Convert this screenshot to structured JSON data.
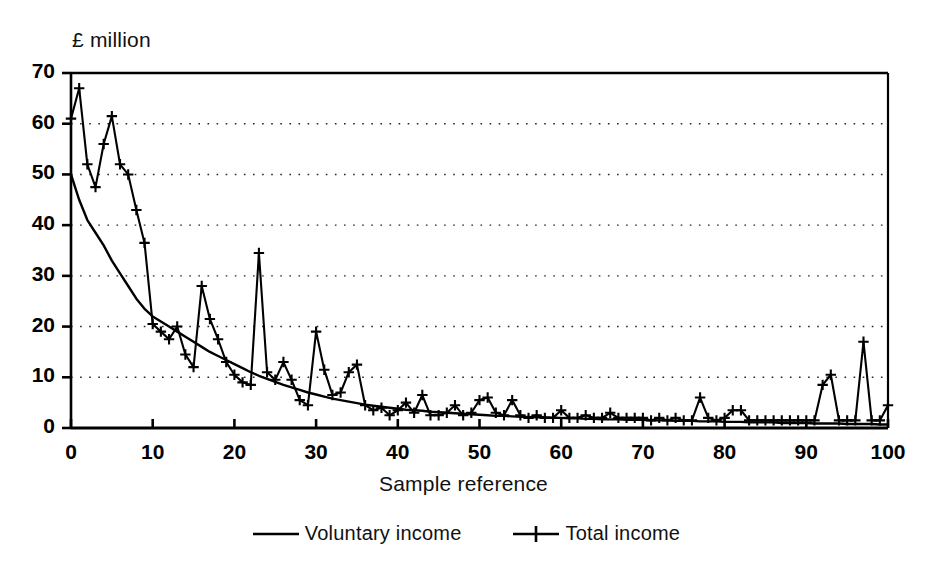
{
  "chart_data": {
    "type": "line",
    "title": "",
    "ylabel": "£ million",
    "xlabel": "Sample reference",
    "xlim": [
      0,
      100
    ],
    "ylim": [
      0,
      70
    ],
    "xticks": [
      0,
      10,
      20,
      30,
      40,
      50,
      60,
      70,
      80,
      90,
      100
    ],
    "yticks": [
      0,
      10,
      20,
      30,
      40,
      50,
      60,
      70
    ],
    "grid": "horizontal-dotted",
    "legend_position": "below-axes",
    "line_color": "#000000",
    "series": [
      {
        "name": "Voluntary income",
        "marker": "none",
        "values": [
          50.0,
          45.0,
          41.0,
          38.5,
          36.0,
          33.0,
          30.5,
          28.0,
          25.5,
          23.5,
          22.0,
          21.0,
          20.0,
          19.0,
          18.0,
          17.0,
          16.0,
          15.0,
          14.2,
          13.4,
          12.6,
          11.8,
          11.0,
          10.3,
          9.7,
          9.1,
          8.5,
          8.0,
          7.5,
          7.0,
          6.6,
          6.2,
          5.8,
          5.5,
          5.2,
          4.9,
          4.6,
          4.4,
          4.2,
          4.0,
          3.8,
          3.6,
          3.5,
          3.4,
          3.2,
          3.1,
          3.0,
          2.9,
          2.8,
          2.7,
          2.6,
          2.5,
          2.4,
          2.4,
          2.3,
          2.2,
          2.2,
          2.1,
          2.1,
          2.0,
          2.0,
          1.9,
          1.9,
          1.8,
          1.8,
          1.7,
          1.7,
          1.7,
          1.6,
          1.6,
          1.6,
          1.5,
          1.5,
          1.5,
          1.4,
          1.4,
          1.4,
          1.3,
          1.3,
          1.3,
          1.2,
          1.2,
          1.2,
          1.1,
          1.1,
          1.1,
          1.1,
          1.0,
          1.0,
          1.0,
          1.0,
          0.9,
          0.9,
          0.9,
          0.9,
          0.8,
          0.8,
          0.8,
          0.8,
          0.7,
          0.7
        ]
      },
      {
        "name": "Total income",
        "marker": "plus",
        "values": [
          61.0,
          67.0,
          52.0,
          47.5,
          56.0,
          61.5,
          52.0,
          50.0,
          43.0,
          36.5,
          20.5,
          19.0,
          17.5,
          20.0,
          14.5,
          12.0,
          28.0,
          21.5,
          17.5,
          13.0,
          10.5,
          9.0,
          8.5,
          34.5,
          11.0,
          9.5,
          13.0,
          9.5,
          5.5,
          4.5,
          19.0,
          11.5,
          6.5,
          7.0,
          11.0,
          12.5,
          4.5,
          3.5,
          4.0,
          2.5,
          3.5,
          5.0,
          3.0,
          6.5,
          2.5,
          2.5,
          3.0,
          4.5,
          2.5,
          3.0,
          5.5,
          6.0,
          3.0,
          2.5,
          5.5,
          2.5,
          2.0,
          2.5,
          2.0,
          2.0,
          3.5,
          2.0,
          2.0,
          2.5,
          2.0,
          2.0,
          3.0,
          2.0,
          2.0,
          2.0,
          2.0,
          1.5,
          2.0,
          1.5,
          2.0,
          1.5,
          1.5,
          6.0,
          2.0,
          1.5,
          2.0,
          3.5,
          3.5,
          1.5,
          1.5,
          1.5,
          1.5,
          1.5,
          1.5,
          1.5,
          1.5,
          1.5,
          8.5,
          10.5,
          1.5,
          1.5,
          1.5,
          17.0,
          1.5,
          1.5,
          4.5
        ]
      }
    ]
  },
  "legend": {
    "items": [
      {
        "label": "Voluntary income",
        "marker": "line"
      },
      {
        "label": "Total income",
        "marker": "line-plus"
      }
    ]
  }
}
